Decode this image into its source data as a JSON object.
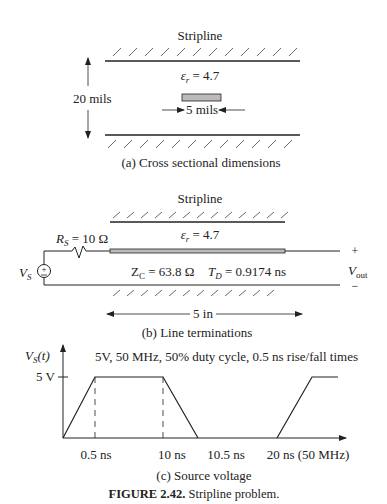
{
  "panel_a": {
    "title": "Stripline",
    "epsilon_label": "ε",
    "epsilon_sub": "r",
    "epsilon_value": " = 4.7",
    "height_label": "20 mils",
    "width_label": "5 mils",
    "caption": "(a) Cross sectional dimensions"
  },
  "panel_b": {
    "title": "Stripline",
    "epsilon_label": "ε",
    "epsilon_sub": "r",
    "epsilon_value": " = 4.7",
    "rs_label": "R",
    "rs_sub": "S",
    "rs_value": " = 10 Ω",
    "vs_label": "V",
    "vs_sub": "S",
    "zc_label": "Z",
    "zc_sub": "C",
    "zc_value": " = 63.8 Ω",
    "td_label": "T",
    "td_sub": "D",
    "td_value": " = 0.9174 ns",
    "vout_label": "V",
    "vout_sub": "out",
    "plus": "+",
    "minus": "−",
    "length_label": "5 in",
    "caption": "(b) Line terminations"
  },
  "panel_c": {
    "ylabel": "V",
    "ylabel_sub": "S",
    "ylabel_arg": "(t)",
    "description": "5V, 50 MHz, 50% duty cycle, 0.5 ns rise/fall times",
    "ytick": "5 V",
    "xticks": [
      "0.5 ns",
      "10 ns",
      "10.5 ns",
      "20 ns (50 MHz)"
    ],
    "caption": "(c) Source voltage"
  },
  "figure": {
    "label": "FIGURE 2.42.",
    "title": "Stripline problem."
  }
}
